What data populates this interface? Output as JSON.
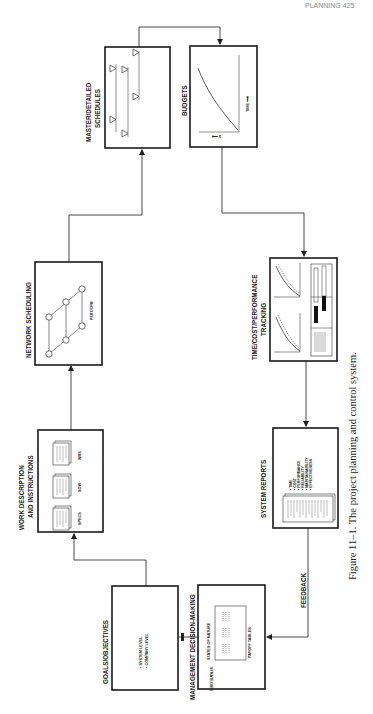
{
  "page": {
    "running_head": "PLANNING   425",
    "caption": "Figure 11–1.  The project planning and control system.",
    "orientation": "rotated 90° counter-clockwise (landscape figure on portrait page)"
  },
  "nodes": {
    "goals": {
      "title": "GOALS/OBJECTIVES",
      "bullets": [
        "• SYSTEM LEVEL",
        "• COMPANY LEVEL"
      ]
    },
    "management": {
      "title": "MANAGEMENT DECISION-MAKING",
      "labels": {
        "top": "STATES OF NATURE",
        "side": "STRATEGIES",
        "bottom": "PAYOFF TABLES"
      }
    },
    "work_description": {
      "title_line1": "WORK DESCRIPTION",
      "title_line2": "AND INSTRUCTIONS",
      "documents": [
        "SPECS",
        "SOW",
        "WBS"
      ]
    },
    "network_scheduling": {
      "title": "NETWORK SCHEDULING",
      "sublabel": "PERT/CPM"
    },
    "schedules": {
      "title_line1": "MASTER/DETAILED",
      "title_line2": "SCHEDULES"
    },
    "budgets": {
      "title": "BUDGETS",
      "axis_x": "TIME ⟶",
      "axis_y": "⟵ $"
    },
    "tracking": {
      "title_line1": "TIME/COST/PERFORMANCE",
      "title_line2": "TRACKING"
    },
    "system_reports": {
      "title": "SYSTEM REPORTS",
      "bullets": [
        "• TIME",
        "• COST",
        "• PERFORMANCE",
        "• RELIABILITY",
        "• MAINTAINABILITY",
        "• EFFECTIVENESS"
      ]
    }
  },
  "edges": {
    "feedback_label": "FEEDBACK",
    "flow": [
      "GOALS/OBJECTIVES → WORK DESCRIPTION AND INSTRUCTIONS",
      "WORK DESCRIPTION AND INSTRUCTIONS → NETWORK SCHEDULING",
      "NETWORK SCHEDULING → MASTER/DETAILED SCHEDULES",
      "MASTER/DETAILED SCHEDULES → BUDGETS",
      "BUDGETS → TIME/COST/PERFORMANCE TRACKING",
      "TIME/COST/PERFORMANCE TRACKING → SYSTEM REPORTS",
      "SYSTEM REPORTS → MANAGEMENT DECISION-MAKING (FEEDBACK)",
      "MANAGEMENT DECISION-MAKING → GOALS/OBJECTIVES"
    ]
  }
}
